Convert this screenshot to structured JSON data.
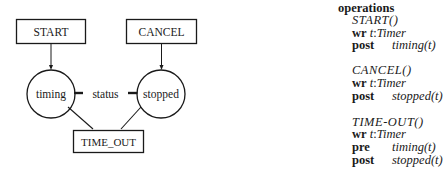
{
  "diagram": {
    "operations_boxes": [
      {
        "id": "start",
        "label": "START"
      },
      {
        "id": "cancel",
        "label": "CANCEL"
      },
      {
        "id": "time_out",
        "label": "TIME_OUT"
      }
    ],
    "states": [
      {
        "id": "timing",
        "label": "timing"
      },
      {
        "id": "stopped",
        "label": "stopped"
      }
    ],
    "attribute_label": "status",
    "colors": {
      "stroke": "#1a1a1a",
      "background": "#ffffff"
    }
  },
  "spec": {
    "heading": "operations",
    "operations": [
      {
        "signature": "START()",
        "clauses": [
          {
            "keyword": "wr",
            "var": "t",
            "type": "Timer"
          },
          {
            "keyword": "post",
            "expr": "timing(t)"
          }
        ]
      },
      {
        "signature": "CANCEL()",
        "clauses": [
          {
            "keyword": "wr",
            "var": "t",
            "type": "Timer"
          },
          {
            "keyword": "post",
            "expr": "stopped(t)"
          }
        ]
      },
      {
        "signature": "TIME-OUT()",
        "clauses": [
          {
            "keyword": "wr",
            "var": "t",
            "type": "Timer"
          },
          {
            "keyword": "pre",
            "expr": "timing(t)"
          },
          {
            "keyword": "post",
            "expr": "stopped(t)"
          }
        ]
      }
    ]
  }
}
